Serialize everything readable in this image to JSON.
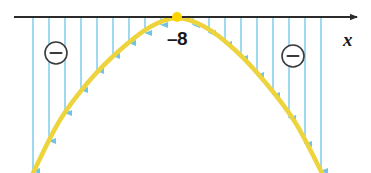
{
  "figure": {
    "width": 371,
    "height": 173,
    "background": "#ffffff"
  },
  "axis": {
    "name": "x-axis",
    "label": "x",
    "label_x": 343,
    "label_y": 30,
    "y": 17,
    "x_start": 14,
    "x_end": 357,
    "color": "#2b2b2b",
    "stroke_width": 2.2,
    "arrowhead": "right"
  },
  "vertex": {
    "label": "–8",
    "label_x": 177,
    "label_y": 29,
    "dot_x": 177,
    "dot_y": 17,
    "dot_radius": 5,
    "dot_color": "#FFD400"
  },
  "curve": {
    "name": "parabola",
    "color": "#EDD43C",
    "stroke_width": 4.5,
    "orientation": "opens-down",
    "vertex_x": 177,
    "vertex_y": 17,
    "points": [
      {
        "x": 33,
        "y": 173
      },
      {
        "x": 60,
        "y": 120
      },
      {
        "x": 90,
        "y": 80
      },
      {
        "x": 120,
        "y": 50
      },
      {
        "x": 150,
        "y": 27
      },
      {
        "x": 177,
        "y": 18
      },
      {
        "x": 205,
        "y": 27
      },
      {
        "x": 235,
        "y": 50
      },
      {
        "x": 265,
        "y": 82
      },
      {
        "x": 295,
        "y": 122
      },
      {
        "x": 322,
        "y": 173
      }
    ]
  },
  "arrows": {
    "name": "downward-arrows",
    "color": "#6EC4E8",
    "stroke_width": 1.3,
    "head_width": 5,
    "head_length": 7,
    "count": 18,
    "items": [
      {
        "x": 33,
        "y_top": 18,
        "y_bottom": 171
      },
      {
        "x": 49,
        "y_top": 18,
        "y_bottom": 141
      },
      {
        "x": 65,
        "y_top": 18,
        "y_bottom": 113
      },
      {
        "x": 81,
        "y_top": 18,
        "y_bottom": 90
      },
      {
        "x": 97,
        "y_top": 18,
        "y_bottom": 71
      },
      {
        "x": 113,
        "y_top": 18,
        "y_bottom": 56
      },
      {
        "x": 129,
        "y_top": 18,
        "y_bottom": 43
      },
      {
        "x": 145,
        "y_top": 18,
        "y_bottom": 33
      },
      {
        "x": 161,
        "y_top": 18,
        "y_bottom": 25
      },
      {
        "x": 193,
        "y_top": 18,
        "y_bottom": 25
      },
      {
        "x": 209,
        "y_top": 18,
        "y_bottom": 33
      },
      {
        "x": 225,
        "y_top": 18,
        "y_bottom": 44
      },
      {
        "x": 241,
        "y_top": 18,
        "y_bottom": 58
      },
      {
        "x": 257,
        "y_top": 18,
        "y_bottom": 75
      },
      {
        "x": 273,
        "y_top": 18,
        "y_bottom": 95
      },
      {
        "x": 289,
        "y_top": 18,
        "y_bottom": 118
      },
      {
        "x": 305,
        "y_top": 18,
        "y_bottom": 144
      },
      {
        "x": 321,
        "y_top": 18,
        "y_bottom": 171
      }
    ]
  },
  "sign_markers": {
    "name": "circled-minus-signs",
    "symbol": "−",
    "circle_color": "#3a3a3a",
    "circle_fill": "#ffffff",
    "radius": 11,
    "items": [
      {
        "label": "left-negative-region",
        "cx": 56,
        "cy": 53
      },
      {
        "label": "right-negative-region",
        "cx": 293,
        "cy": 56
      }
    ]
  }
}
